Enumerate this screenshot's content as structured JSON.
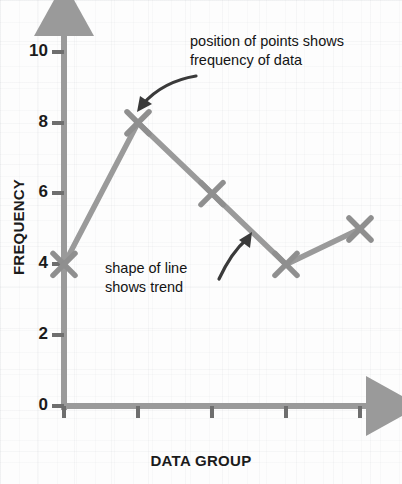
{
  "chart_data": {
    "type": "line",
    "title": "",
    "xlabel": "DATA GROUP",
    "ylabel": "FREQUENCY",
    "categories": [
      "1",
      "2",
      "3",
      "4",
      "5"
    ],
    "values": [
      4,
      8,
      6,
      4,
      5
    ],
    "ylim": [
      0,
      10
    ],
    "y_ticks": [
      0,
      2,
      4,
      6,
      8,
      10
    ],
    "y_tick_labels": [
      "0",
      "2",
      "4",
      "6",
      "8",
      "10"
    ],
    "x_tick_labels": [
      "",
      "",
      "",
      "",
      ""
    ],
    "grid": false,
    "legend": "none",
    "marker": "x",
    "line_color": "#9a9a9a",
    "marker_color": "#8f8f8f",
    "axis_color": "#9a9a9a",
    "text_color": "#1b1b1b",
    "annotations": [
      {
        "id": "points-annotation",
        "text": "position of points shows\nfrequency of data",
        "points_to": [
          138,
          123
        ]
      },
      {
        "id": "trend-annotation",
        "text": "shape of line\nshows trend",
        "points_to": [
          252,
          228
        ]
      }
    ]
  },
  "axis": {
    "y_title": "FREQUENCY",
    "x_title": "DATA GROUP"
  },
  "y_ticks": {
    "t0": "0",
    "t2": "2",
    "t4": "4",
    "t6": "6",
    "t8": "8",
    "t10": "10"
  },
  "annotations": {
    "points_line1": "position of points shows",
    "points_line2": "frequency of data",
    "trend_line1": "shape of line",
    "trend_line2": "shows trend"
  }
}
